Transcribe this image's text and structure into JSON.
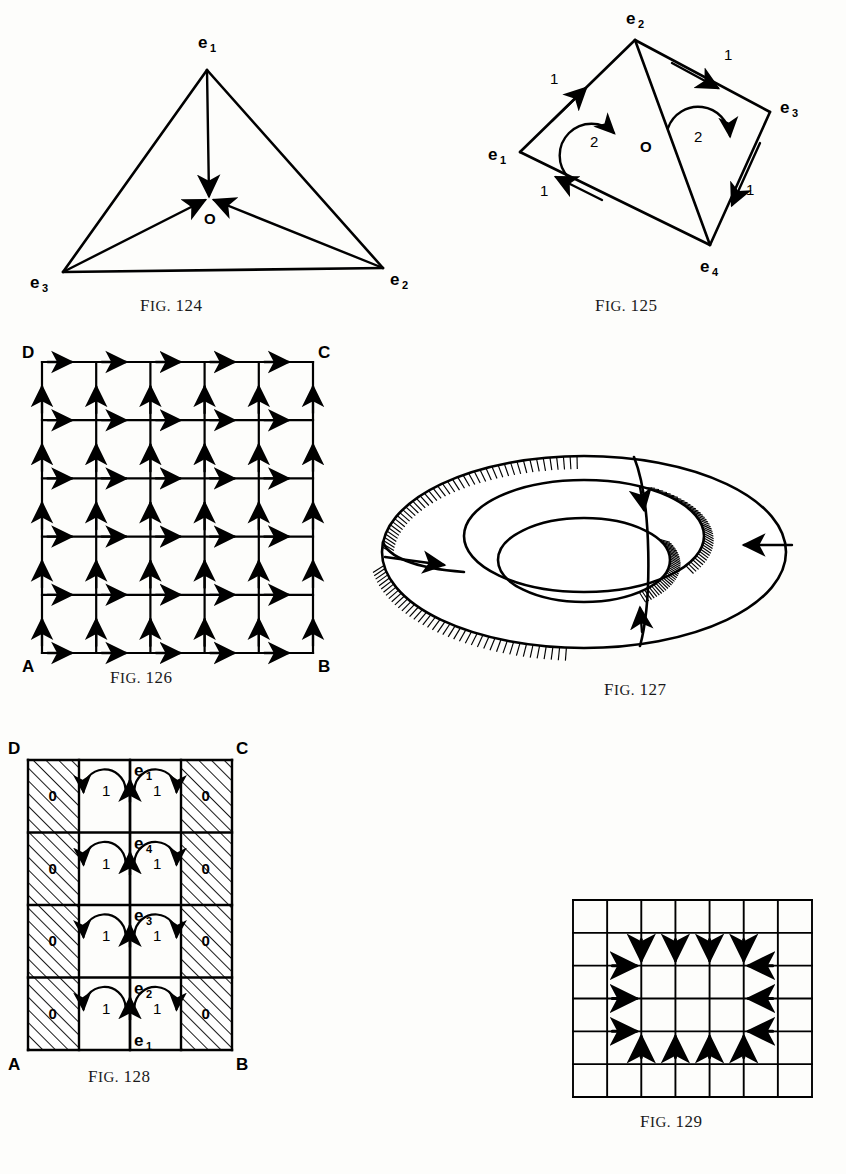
{
  "page": {
    "width": 846,
    "height": 1174,
    "background": "#fdfdfb",
    "ink": "#000000"
  },
  "figures": [
    {
      "id": "fig-124",
      "caption_prefix": "Fig.",
      "caption_number": "124",
      "caption_text": "FIG. 124",
      "description": "Triangle with vertices e1, e2, e3 and interior point O; arrows point inward to O",
      "vertices": [
        {
          "name": "e",
          "sub": "1",
          "position": "top"
        },
        {
          "name": "e",
          "sub": "3",
          "position": "bottom-left"
        },
        {
          "name": "e",
          "sub": "2",
          "position": "bottom-right"
        }
      ],
      "center_label": "O",
      "arrows": [
        {
          "from": "e1",
          "to": "O",
          "direction": "down"
        },
        {
          "from": "e3",
          "to": "O",
          "direction": "up-right"
        },
        {
          "from": "e2",
          "to": "O",
          "direction": "up-left"
        }
      ]
    },
    {
      "id": "fig-125",
      "caption_prefix": "Fig.",
      "caption_number": "125",
      "caption_text": "FIG. 125",
      "description": "Rhombus e1 e2 e3 e4 with vertical diagonal labelled O; outer edges labelled 1; two curved arrows labelled 2",
      "vertices": [
        {
          "name": "e",
          "sub": "2",
          "position": "top"
        },
        {
          "name": "e",
          "sub": "3",
          "position": "right"
        },
        {
          "name": "e",
          "sub": "4",
          "position": "bottom"
        },
        {
          "name": "e",
          "sub": "1",
          "position": "left"
        }
      ],
      "diagonal_label": "O",
      "edge_labels": [
        "1",
        "1",
        "1",
        "1"
      ],
      "face_labels": [
        "2",
        "2"
      ]
    },
    {
      "id": "fig-126",
      "caption_prefix": "Fig.",
      "caption_number": "126",
      "caption_text": "FIG. 126",
      "description": "Square ABCD subdivided into a 5 by 5 grid; every horizontal edge points right, every vertical edge points up",
      "corners": {
        "top_left": "D",
        "top_right": "C",
        "bottom_left": "A",
        "bottom_right": "B"
      },
      "grid": {
        "cols": 5,
        "rows": 5
      },
      "horizontal_arrow_direction": "right",
      "vertical_arrow_direction": "up"
    },
    {
      "id": "fig-127",
      "caption_prefix": "Fig.",
      "caption_number": "127",
      "caption_text": "FIG. 127",
      "description": "Torus drawn in perspective with hatched bands and arrows along a meridian and a longitude circle"
    },
    {
      "id": "fig-128",
      "caption_prefix": "Fig.",
      "caption_number": "128",
      "caption_text": "FIG. 128",
      "description": "Square ABCD split into four columns and four rows; outer columns hatched and labelled 0; inner columns carry curved arrows labelled 1; central vertical line has upward arrows labelled e1 e4 e3 e2 e1",
      "corners": {
        "top_left": "D",
        "top_right": "C",
        "bottom_left": "A",
        "bottom_right": "B"
      },
      "grid": {
        "cols": 4,
        "rows": 4
      },
      "hatched_cell_label": "0",
      "rotation_cell_label": "1",
      "axis_labels_top_to_bottom": [
        {
          "name": "e",
          "sub": "1"
        },
        {
          "name": "e",
          "sub": "4"
        },
        {
          "name": "e",
          "sub": "3"
        },
        {
          "name": "e",
          "sub": "2"
        },
        {
          "name": "e",
          "sub": "1"
        }
      ]
    },
    {
      "id": "fig-129",
      "caption_prefix": "Fig.",
      "caption_number": "129",
      "caption_text": "FIG. 129",
      "description": "Seven by six rectangular grid with arrows on the boundary of the inner block pointing inward",
      "grid": {
        "cols": 7,
        "rows": 6
      },
      "arrow_directions": {
        "top_row": "down",
        "bottom_row": "up",
        "left_column": "right",
        "right_column": "left"
      },
      "top_arrow_count": 4,
      "bottom_arrow_count": 4,
      "left_arrow_count": 3,
      "right_arrow_count": 3
    }
  ]
}
